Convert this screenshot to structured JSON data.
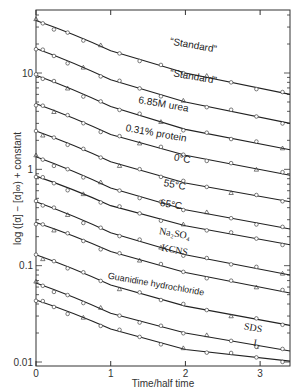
{
  "header_text": "",
  "chart_data": {
    "type": "line",
    "title": "",
    "xlabel": "Time/half time",
    "ylabel": "log ([α] − [α]∞) + constant",
    "yscale": "log",
    "xlim": [
      0,
      3.4
    ],
    "ylim": [
      0.01,
      40
    ],
    "x_ticks": [
      "0",
      "1",
      "2",
      "3"
    ],
    "y_ticks": [
      "0.01",
      "0.1",
      "1",
      "10"
    ],
    "grid": false,
    "legend": "inline labels on curves",
    "series": [
      {
        "name": "\"Standard\"",
        "label": "“Standard”",
        "x": [
          0,
          1,
          2,
          3.4
        ],
        "y": [
          35,
          17,
          10,
          6.0
        ],
        "label_pos": [
          2.1,
          18
        ]
      },
      {
        "name": "\"Standard\" (2)",
        "label": "“Standard”",
        "x": [
          0,
          1,
          2,
          3.4
        ],
        "y": [
          18,
          8.5,
          5.0,
          3.0
        ],
        "label_pos": [
          2.1,
          8.5
        ]
      },
      {
        "name": "6.85 M urea",
        "label": "6.85M urea",
        "x": [
          0,
          1,
          2,
          3.4
        ],
        "y": [
          9.5,
          4.5,
          2.6,
          1.6
        ],
        "label_pos": [
          1.7,
          4.4
        ]
      },
      {
        "name": "0.31% protein",
        "label": "0.31% protein",
        "x": [
          0,
          1,
          2,
          3.4
        ],
        "y": [
          4.8,
          2.3,
          1.4,
          0.87
        ],
        "label_pos": [
          1.6,
          2.2
        ]
      },
      {
        "name": "0°C",
        "label": "0°C",
        "x": [
          0,
          1,
          2,
          3.4
        ],
        "y": [
          2.5,
          1.2,
          0.72,
          0.46
        ],
        "label_pos": [
          1.95,
          1.2
        ]
      },
      {
        "name": "55°C",
        "label": "55°C",
        "x": [
          0,
          1,
          2,
          3.4
        ],
        "y": [
          1.35,
          0.64,
          0.38,
          0.24
        ],
        "label_pos": [
          1.85,
          0.64
        ]
      },
      {
        "name": "65°C",
        "label": "65°C",
        "x": [
          0,
          1,
          2,
          3.4
        ],
        "y": [
          0.85,
          0.42,
          0.26,
          0.165
        ],
        "label_pos": [
          1.8,
          0.4
        ]
      },
      {
        "name": "Na2SO4",
        "label": "Na₂SO₄",
        "x": [
          0,
          1,
          2,
          3.4
        ],
        "y": [
          0.46,
          0.22,
          0.13,
          0.08
        ],
        "label_pos": [
          1.85,
          0.2
        ]
      },
      {
        "name": "KCNS",
        "label": "KCNS",
        "x": [
          0,
          1,
          2,
          3.4
        ],
        "y": [
          0.28,
          0.14,
          0.085,
          0.052
        ],
        "label_pos": [
          1.85,
          0.135
        ]
      },
      {
        "name": "Guanidine hydrochloride",
        "label": "Guanidine hydrochloride",
        "x": [
          0,
          1,
          2,
          3.4
        ],
        "y": [
          0.13,
          0.063,
          0.038,
          0.024
        ],
        "label_pos": [
          1.6,
          0.06
        ]
      },
      {
        "name": "SDS",
        "label": "SDS",
        "x": [
          0,
          1,
          2,
          3.4
        ],
        "y": [
          0.066,
          0.032,
          0.02,
          0.013
        ],
        "label_pos": [
          2.9,
          0.021
        ]
      },
      {
        "name": "I2",
        "label": "I₂",
        "x": [
          0,
          1,
          2,
          3.4
        ],
        "y": [
          0.044,
          0.022,
          0.0135,
          0.0102
        ],
        "label_pos": [
          2.95,
          0.0145
        ]
      }
    ]
  }
}
